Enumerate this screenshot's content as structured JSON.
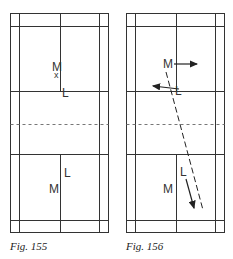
{
  "figures": [
    {
      "caption": "Fig. 155",
      "players": [
        {
          "label": "M",
          "x": 57,
          "y": 67
        },
        {
          "label": "x",
          "x": 57,
          "y": 76,
          "kind": "shuttle-mark"
        },
        {
          "label": "L",
          "x": 64,
          "y": 95
        },
        {
          "label": "L",
          "x": 66,
          "y": 176
        },
        {
          "label": "M",
          "x": 54,
          "y": 192
        }
      ]
    },
    {
      "caption": "Fig. 156",
      "players": [
        {
          "label": "M",
          "x": 167,
          "y": 67
        },
        {
          "label": "L",
          "x": 176,
          "y": 94
        },
        {
          "label": "L",
          "x": 182,
          "y": 175
        },
        {
          "label": "M",
          "x": 164,
          "y": 192
        }
      ],
      "arrows": [
        {
          "name": "M-move-right",
          "from": [
            173,
            64
          ],
          "to": [
            197,
            64
          ],
          "style": "solid"
        },
        {
          "name": "L-move-left",
          "from": [
            178,
            89
          ],
          "to": [
            153,
            86
          ],
          "style": "solid"
        },
        {
          "name": "shuttle-path",
          "from": [
            166,
            72
          ],
          "to": [
            203,
            210
          ],
          "style": "dashed"
        },
        {
          "name": "L-move-back",
          "from": [
            185,
            178
          ],
          "to": [
            194,
            208
          ],
          "style": "solid"
        }
      ]
    }
  ]
}
